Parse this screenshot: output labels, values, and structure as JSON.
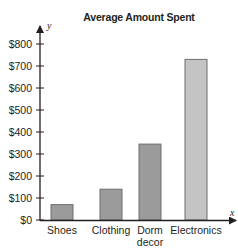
{
  "chart_data": {
    "type": "bar",
    "title": "Average Amount Spent",
    "xlabel": "x",
    "ylabel": "y",
    "categories": [
      "Shoes",
      "Clothing",
      "Dorm decor",
      "Electronics"
    ],
    "category_lines": [
      [
        "Shoes"
      ],
      [
        "Clothing"
      ],
      [
        "Dorm",
        "decor"
      ],
      [
        "Electronics"
      ]
    ],
    "values": [
      70,
      140,
      345,
      730
    ],
    "colors": [
      "#9b9b9b",
      "#9b9b9b",
      "#9b9b9b",
      "#c4c4c4"
    ],
    "ylim": [
      0,
      800
    ],
    "yticks": [
      0,
      100,
      200,
      300,
      400,
      500,
      600,
      700,
      800
    ],
    "ytick_labels": [
      "$0",
      "$100",
      "$200",
      "$300",
      "$400",
      "$500",
      "$600",
      "$700",
      "$800"
    ],
    "grid": false,
    "legend": null
  }
}
